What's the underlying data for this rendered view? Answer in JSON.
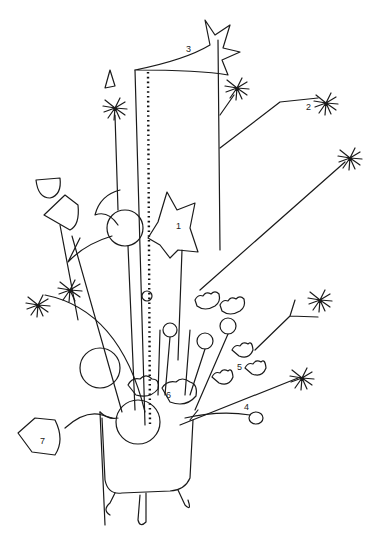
{
  "illustration": {
    "subject": "line drawing of assorted flowers and stems in a three-legged pot",
    "labels": [
      {
        "id": "1",
        "text": "1"
      },
      {
        "id": "2",
        "text": "2"
      },
      {
        "id": "3",
        "text": "3"
      },
      {
        "id": "4",
        "text": "4"
      },
      {
        "id": "5",
        "text": "5"
      },
      {
        "id": "6",
        "text": "6"
      },
      {
        "id": "7",
        "text": "7"
      }
    ],
    "colors": {
      "background": "#ffffff",
      "line": "#1a1a1a"
    }
  }
}
